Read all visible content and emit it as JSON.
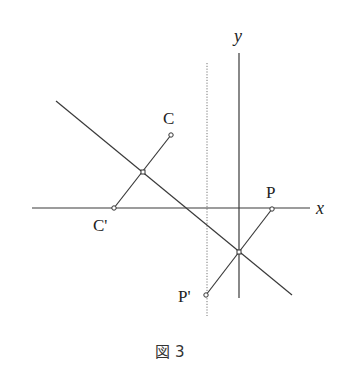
{
  "figure": {
    "caption": "図 3",
    "axes": {
      "x_label": "x",
      "y_label": "y"
    },
    "points": {
      "C": {
        "label": "C",
        "x": 171,
        "y": 135
      },
      "C_prime": {
        "label": "C'",
        "x": 114,
        "y": 208
      },
      "P": {
        "label": "P",
        "x": 272,
        "y": 209
      },
      "P_prime": {
        "label": "P'",
        "x": 206,
        "y": 295
      }
    },
    "midpoints": [
      {
        "x": 143,
        "y": 172
      },
      {
        "x": 239,
        "y": 252
      }
    ],
    "lines": {
      "x_axis": {
        "x1": 32,
        "y1": 208,
        "x2": 310,
        "y2": 208
      },
      "y_axis": {
        "x1": 239,
        "y1": 53,
        "x2": 239,
        "y2": 298
      },
      "diagonal": {
        "x1": 56,
        "y1": 101,
        "x2": 292,
        "y2": 295
      },
      "dotted_vertical": {
        "x1": 207,
        "y1": 63,
        "x2": 207,
        "y2": 316
      }
    },
    "colors": {
      "line": "#3a3a3a",
      "background": "#ffffff"
    }
  }
}
